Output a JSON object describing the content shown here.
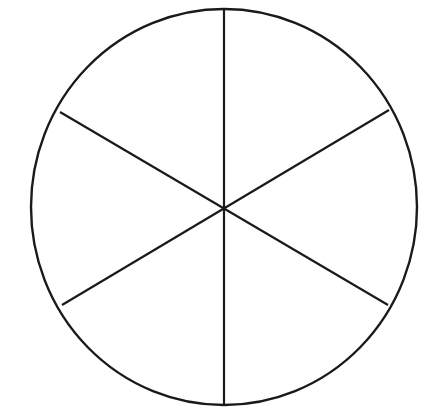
{
  "figure": {
    "type": "line-drawing",
    "background_color": "#ffffff",
    "stroke_color": "#1a1a1a",
    "canvas": {
      "width": 430,
      "height": 417
    },
    "circle": {
      "name": "outline-circle",
      "center_x": 224,
      "center_y": 207,
      "radius_x": 193,
      "radius_y": 198,
      "stroke_width": 2.4,
      "fill": "none"
    },
    "sector_count": 6,
    "sector_angle_degrees": 60,
    "dividers": [
      {
        "name": "vertical-diameter",
        "angle_degrees": 90,
        "x1": 224,
        "y1": 9,
        "x2": 224,
        "y2": 405,
        "stroke_width": 2.2
      },
      {
        "name": "diagonal-diameter-nw-se",
        "angle_degrees": 30,
        "x1": 60,
        "y1": 112,
        "x2": 388,
        "y2": 305,
        "stroke_width": 2.2
      },
      {
        "name": "diagonal-diameter-sw-ne",
        "angle_degrees": 150,
        "x1": 62,
        "y1": 305,
        "x2": 389,
        "y2": 110,
        "stroke_width": 2.2
      }
    ],
    "center_point": {
      "name": "center-vertex",
      "x": 224,
      "y": 207
    },
    "sectors": [
      {
        "label": "",
        "start_angle": 30,
        "end_angle": 90,
        "fraction": "1/6"
      },
      {
        "label": "",
        "start_angle": 90,
        "end_angle": 150,
        "fraction": "1/6"
      },
      {
        "label": "",
        "start_angle": 150,
        "end_angle": 210,
        "fraction": "1/6"
      },
      {
        "label": "",
        "start_angle": 210,
        "end_angle": 270,
        "fraction": "1/6"
      },
      {
        "label": "",
        "start_angle": 270,
        "end_angle": 330,
        "fraction": "1/6"
      },
      {
        "label": "",
        "start_angle": 330,
        "end_angle": 30,
        "fraction": "1/6"
      }
    ]
  }
}
